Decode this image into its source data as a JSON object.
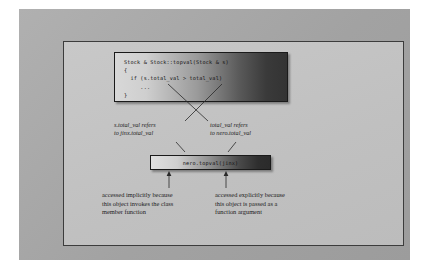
{
  "figure": {
    "code_box": {
      "lines": [
        "Stock & Stock::topval(Stock & s)",
        "{",
        "  if (s.total_val > total_val)",
        "     ...",
        "}"
      ],
      "text": "Stock & Stock::topval(Stock & s)\n{\n  if (s.total_val > total_val)\n     ...\n}"
    },
    "call_box": {
      "text": "nero.topval(jinx)"
    },
    "labels": {
      "left": "s.total_val refers\nto jinx.total_val",
      "right": "total_val refers\nto nero.total_val"
    },
    "captions": {
      "left": "accessed implicitly because\nthis object invokes the class\nmember function",
      "right": "accessed explicitly because\nthis object is passed as a\nfunction argument"
    }
  },
  "colors": {
    "outer_frame": "#a8a8a8",
    "inner_panel": "#c3c3c3",
    "box_border": "#1a1a1a",
    "text": "#1d1d1d",
    "connector": "#2a2a2a"
  }
}
